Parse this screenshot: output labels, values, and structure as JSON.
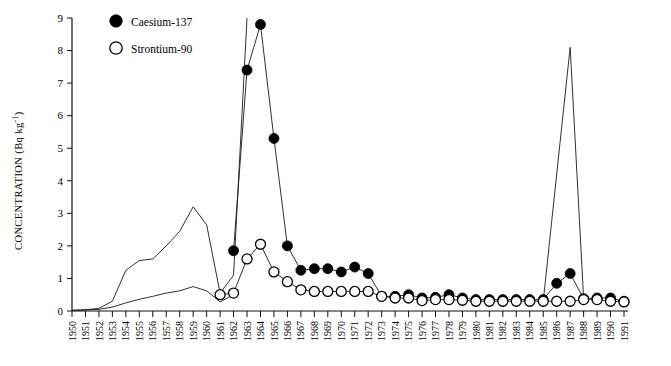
{
  "chart_data": {
    "type": "line",
    "title": "",
    "xlabel": "",
    "ylabel": "CONCENTRATION (Bq kg",
    "ylabel_sup": "-1",
    "ylabel_close": ")",
    "xlim": [
      1950,
      1991
    ],
    "ylim": [
      0,
      9
    ],
    "grid": false,
    "legend_position": "top-left-inside",
    "yticks": [
      0,
      1,
      2,
      3,
      4,
      5,
      6,
      7,
      8,
      9
    ],
    "ytick_labels": [
      "0",
      "1",
      "2",
      "3",
      "4",
      "5",
      "6",
      "7",
      "8",
      "9"
    ],
    "xticks": [
      1950,
      1951,
      1952,
      1953,
      1954,
      1955,
      1956,
      1957,
      1958,
      1959,
      1960,
      1961,
      1962,
      1963,
      1964,
      1965,
      1966,
      1967,
      1968,
      1969,
      1970,
      1971,
      1972,
      1973,
      1974,
      1975,
      1976,
      1977,
      1978,
      1979,
      1980,
      1981,
      1982,
      1983,
      1984,
      1985,
      1986,
      1987,
      1988,
      1989,
      1990,
      1991
    ],
    "xtick_labels": [
      "1950",
      "1951",
      "1952",
      "1953",
      "1954",
      "1955",
      "1956",
      "1957",
      "1958",
      "1959",
      "1960",
      "1961",
      "1962",
      "1963",
      "1964",
      "1965",
      "1966",
      "1967",
      "1968",
      "1969",
      "1970",
      "1971",
      "1972",
      "1973",
      "1974",
      "1975",
      "1976",
      "1977",
      "1978",
      "1979",
      "1980",
      "1981",
      "1982",
      "1983",
      "1984",
      "1985",
      "1986",
      "1987",
      "1988",
      "1989",
      "1990",
      "1991"
    ],
    "series": [
      {
        "name": "Caesium-137",
        "marker": "filled-circle",
        "color": "#000000",
        "x": [
          1962,
          1963,
          1964,
          1965,
          1966,
          1967,
          1968,
          1969,
          1970,
          1971,
          1972,
          1973,
          1974,
          1975,
          1976,
          1977,
          1978,
          1979,
          1980,
          1981,
          1982,
          1983,
          1984,
          1985,
          1986,
          1987,
          1988,
          1989,
          1990,
          1991
        ],
        "values": [
          1.85,
          7.4,
          8.8,
          5.3,
          2.0,
          1.25,
          1.3,
          1.3,
          1.2,
          1.35,
          1.15,
          0.45,
          0.45,
          0.5,
          0.4,
          0.42,
          0.5,
          0.4,
          0.35,
          0.35,
          0.35,
          0.35,
          0.35,
          0.35,
          0.85,
          1.15,
          0.38,
          0.4,
          0.4,
          0.3
        ]
      },
      {
        "name": "Strontium-90",
        "marker": "open-circle",
        "color": "#000000",
        "x": [
          1961,
          1962,
          1963,
          1964,
          1965,
          1966,
          1967,
          1968,
          1969,
          1970,
          1971,
          1972,
          1973,
          1974,
          1975,
          1976,
          1977,
          1978,
          1979,
          1980,
          1981,
          1982,
          1983,
          1984,
          1985,
          1986,
          1987,
          1988,
          1989,
          1990,
          1991
        ],
        "values": [
          0.5,
          0.55,
          1.6,
          2.05,
          1.2,
          0.9,
          0.65,
          0.6,
          0.6,
          0.6,
          0.6,
          0.6,
          0.45,
          0.4,
          0.4,
          0.32,
          0.35,
          0.35,
          0.33,
          0.3,
          0.3,
          0.3,
          0.3,
          0.3,
          0.3,
          0.3,
          0.3,
          0.35,
          0.35,
          0.3,
          0.28
        ]
      },
      {
        "name": "upper-unmarked-curve",
        "marker": "none",
        "color": "#1a1a1a",
        "x": [
          1950,
          1951,
          1952,
          1953,
          1954,
          1955,
          1956,
          1957,
          1958,
          1959,
          1960,
          1961,
          1962,
          1963
        ],
        "values": [
          0.02,
          0.04,
          0.08,
          0.3,
          1.25,
          1.55,
          1.6,
          2.0,
          2.45,
          3.2,
          2.65,
          0.55,
          1.1,
          9.0
        ]
      },
      {
        "name": "lower-unmarked-curve",
        "marker": "none",
        "color": "#1a1a1a",
        "x": [
          1950,
          1951,
          1952,
          1953,
          1954,
          1955,
          1956,
          1957,
          1958,
          1959,
          1960,
          1961,
          1962
        ],
        "values": [
          0.02,
          0.03,
          0.05,
          0.12,
          0.25,
          0.36,
          0.45,
          0.55,
          0.62,
          0.75,
          0.62,
          0.28,
          0.5
        ]
      },
      {
        "name": "chernobyl-spike",
        "marker": "none",
        "color": "#1a1a1a",
        "x": [
          1985,
          1987,
          1988
        ],
        "values": [
          0.3,
          8.1,
          0.4
        ]
      }
    ],
    "annotations": []
  },
  "legend": {
    "entries": [
      {
        "label": "Caesium-137",
        "marker": "filled-circle"
      },
      {
        "label": "Strontium-90",
        "marker": "open-circle"
      }
    ]
  }
}
